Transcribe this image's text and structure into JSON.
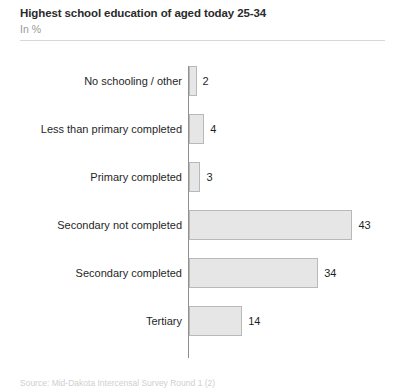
{
  "header": {
    "title": "Highest school education of aged today 25-34",
    "subtitle": "In %"
  },
  "footnote": {
    "text": "Source: Mid-Dakota Intercensal Survey Round 1 (2)"
  },
  "chart_data": {
    "type": "bar",
    "orientation": "horizontal",
    "title": "Highest school education of aged today 25-34",
    "subtitle": "In %",
    "xlabel": "",
    "ylabel": "",
    "unit": "%",
    "grid": false,
    "legend": false,
    "xlim": [
      0,
      45
    ],
    "categories": [
      "No schooling / other",
      "Less than primary completed",
      "Primary completed",
      "Secondary not completed",
      "Secondary completed",
      "Tertiary"
    ],
    "values": [
      2,
      4,
      3,
      43,
      34,
      14
    ],
    "value_labels": [
      "2",
      "4",
      "3",
      "43",
      "34",
      "14"
    ],
    "bar_fill": "#e6e6e6",
    "bar_border": "#b9b9b9"
  }
}
